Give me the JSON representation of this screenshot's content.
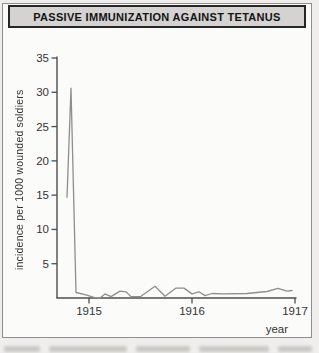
{
  "figure": {
    "title": "PASSIVE IMMUNIZATION AGAINST TETANUS",
    "x_axis_label": "year",
    "y_axis_label": "incidence per 1000 wounded soldiers"
  },
  "colors": {
    "page_bg": "#efeeec",
    "panel_bg": "#fbfbfa",
    "panel_border": "#8f8f8d",
    "title_bar_bg": "#d4d3d1",
    "title_border": "#262626",
    "title_text": "#141414",
    "axis": "#4e4e4e",
    "tick_label": "#333333",
    "data_line": "#8e8e8e"
  },
  "chart_data": {
    "type": "line",
    "title": "PASSIVE IMMUNIZATION AGAINST TETANUS",
    "xlabel": "year",
    "ylabel": "incidence per 1000 wounded soldiers",
    "xlim": [
      1914.69,
      1917.02
    ],
    "ylim": [
      0,
      35
    ],
    "x_ticks": [
      1915,
      1916,
      1917
    ],
    "y_ticks": [
      5,
      10,
      15,
      20,
      25,
      30,
      35
    ],
    "grid": false,
    "legend": false,
    "series": [
      {
        "name": "tetanus incidence per 1000 wounded soldiers",
        "points": [
          [
            1914.786,
            14.7
          ],
          [
            1914.825,
            30.6
          ],
          [
            1914.874,
            0.8
          ],
          [
            1914.961,
            0.5
          ],
          [
            1915.049,
            0.1
          ],
          [
            1915.107,
            0.0
          ],
          [
            1915.155,
            0.6
          ],
          [
            1915.214,
            0.2
          ],
          [
            1915.301,
            1.0
          ],
          [
            1915.359,
            0.9
          ],
          [
            1915.408,
            0.2
          ],
          [
            1915.505,
            0.25
          ],
          [
            1915.641,
            1.7
          ],
          [
            1915.738,
            0.25
          ],
          [
            1915.845,
            1.45
          ],
          [
            1915.922,
            1.45
          ],
          [
            1916.0,
            0.6
          ],
          [
            1916.068,
            0.9
          ],
          [
            1916.126,
            0.35
          ],
          [
            1916.194,
            0.65
          ],
          [
            1916.301,
            0.6
          ],
          [
            1916.534,
            0.65
          ],
          [
            1916.728,
            0.95
          ],
          [
            1916.835,
            1.4
          ],
          [
            1916.922,
            1.0
          ],
          [
            1916.971,
            1.1
          ]
        ]
      }
    ]
  }
}
